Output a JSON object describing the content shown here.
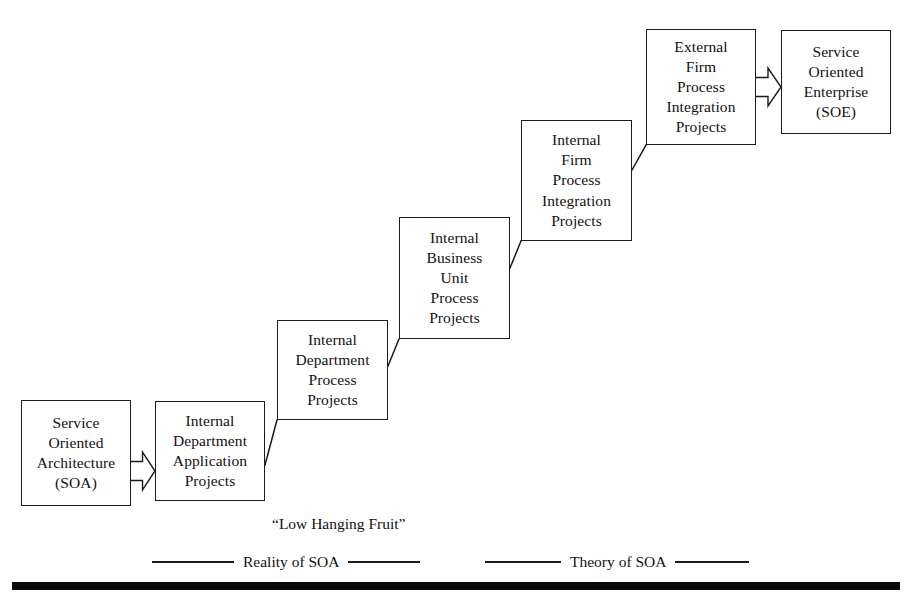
{
  "diagram": {
    "background_color": "#ffffff",
    "line_color": "#1a1a1a",
    "nodes": [
      {
        "id": "soa",
        "lines": [
          "Service",
          "Oriented",
          "Architecture",
          "(SOA)"
        ],
        "x": 21,
        "y": 400,
        "w": 110,
        "h": 106
      },
      {
        "id": "internal-department-application-projects",
        "lines": [
          "Internal",
          "Department",
          "Application",
          "Projects"
        ],
        "x": 155,
        "y": 401,
        "w": 110,
        "h": 100
      },
      {
        "id": "internal-department-process-projects",
        "lines": [
          "Internal",
          "Department",
          "Process",
          "Projects"
        ],
        "x": 277,
        "y": 320,
        "w": 111,
        "h": 100
      },
      {
        "id": "internal-business-unit-process-projects",
        "lines": [
          "Internal",
          "Business",
          "Unit",
          "Process",
          "Projects"
        ],
        "x": 399,
        "y": 217,
        "w": 111,
        "h": 122
      },
      {
        "id": "internal-firm-process-integration-projects",
        "lines": [
          "Internal",
          "Firm",
          "Process",
          "Integration",
          "Projects"
        ],
        "x": 521,
        "y": 120,
        "w": 111,
        "h": 121
      },
      {
        "id": "external-firm-process-integration-projects",
        "lines": [
          "External",
          "Firm",
          "Process",
          "Integration",
          "Projects"
        ],
        "x": 646,
        "y": 29,
        "w": 110,
        "h": 116
      },
      {
        "id": "soe",
        "lines": [
          "Service",
          "Oriented",
          "Enterprise",
          "(SOE)"
        ],
        "x": 781,
        "y": 30,
        "w": 110,
        "h": 104
      }
    ],
    "block_arrows": [
      {
        "id": "soa-to-internal-department-application",
        "from": "soa",
        "to": "internal-department-application-projects",
        "x": 131,
        "y": 452,
        "w": 24,
        "h": 38
      },
      {
        "id": "external-firm-to-soe",
        "from": "external-firm-process-integration-projects",
        "to": "soe",
        "x": 756,
        "y": 68,
        "w": 25,
        "h": 38
      }
    ],
    "step_connectors": [
      {
        "id": "step-1",
        "x1": 265,
        "y1": 465,
        "x2": 277,
        "y2": 420
      },
      {
        "id": "step-2",
        "x1": 388,
        "y1": 366,
        "x2": 399,
        "y2": 339
      },
      {
        "id": "step-3",
        "x1": 510,
        "y1": 268,
        "x2": 521,
        "y2": 241
      },
      {
        "id": "step-4",
        "x1": 632,
        "y1": 170,
        "x2": 646,
        "y2": 145
      }
    ],
    "step_risers": [
      {
        "id": "riser-1",
        "x1": 277,
        "y1": 420,
        "x2": 265,
        "y2": 465
      },
      {
        "id": "riser-2",
        "x1": 399,
        "y1": 339,
        "x2": 388,
        "y2": 366
      },
      {
        "id": "riser-3",
        "x1": 521,
        "y1": 241,
        "x2": 510,
        "y2": 268
      },
      {
        "id": "riser-4",
        "x1": 646,
        "y1": 145,
        "x2": 632,
        "y2": 170
      }
    ],
    "annotations": {
      "low_hanging_fruit": {
        "text": "“Low Hanging Fruit”",
        "x": 272,
        "y": 515
      }
    },
    "legend": {
      "reality": {
        "label": "Reality of SOA",
        "rule_left_width": 82,
        "rule_right_width": 72,
        "x": 152,
        "y": 553
      },
      "theory": {
        "label": "Theory of SOA",
        "rule_left_width": 76,
        "rule_right_width": 74,
        "x": 485,
        "y": 553
      }
    },
    "baseline_bar": {
      "x": 12,
      "y": 582,
      "w": 888,
      "h": 8,
      "color": "#0a0a0a"
    }
  }
}
